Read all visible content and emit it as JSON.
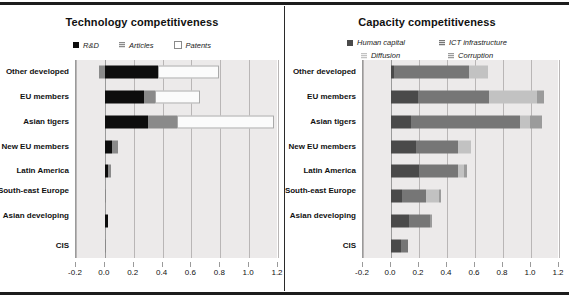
{
  "figure": {
    "background": "#ffffff",
    "plot_background": "#eceaea",
    "rule_color": "#1d1d1d"
  },
  "charts": [
    {
      "id": "technology",
      "title": "Technology competitiveness",
      "legend": [
        {
          "label": "R&D",
          "color": "#0d0d0d",
          "style": "solid"
        },
        {
          "label": "Articles",
          "color": "#8a8a8a",
          "style": "hatch"
        },
        {
          "label": "Patents",
          "color": "#ffffff",
          "style": "outline"
        }
      ],
      "xticks": [
        "-0.2",
        "0.0",
        "0.2",
        "0.4",
        "0.6",
        "0.8",
        "1.0",
        "1.2"
      ],
      "categories": [
        "Other developed",
        "EU members",
        "Asian tigers",
        "New EU members",
        "Latin America",
        "South-east Europe",
        "Asian developing",
        "CIS"
      ]
    },
    {
      "id": "capacity",
      "title": "Capacity competitiveness",
      "legend": [
        {
          "label": "Human capital",
          "color": "#4a4a4a",
          "style": "solid"
        },
        {
          "label": "ICT infrastructure",
          "color": "#767676",
          "style": "hatch"
        },
        {
          "label": "Diffusion",
          "color": "#c2c2c2",
          "style": "hatch"
        },
        {
          "label": "Corruption",
          "color": "#9b9b9b",
          "style": "hatch"
        }
      ],
      "xticks": [
        "-0.2",
        "0.0",
        "0.2",
        "0.4",
        "0.6",
        "0.8",
        "1.0",
        "1.2"
      ],
      "categories": [
        "Other developed",
        "EU members",
        "Asian tigers",
        "New EU members",
        "Latin America",
        "South-east Europe",
        "Asian developing",
        "CIS"
      ]
    }
  ],
  "chart_data": [
    {
      "type": "bar",
      "orientation": "horizontal",
      "stacked": true,
      "title": "Technology competitiveness",
      "xlabel": "",
      "ylabel": "",
      "xlim": [
        -0.2,
        1.2
      ],
      "xticks": [
        -0.2,
        0.0,
        0.2,
        0.4,
        0.6,
        0.8,
        1.0,
        1.2
      ],
      "grid": true,
      "legend_position": "top-center",
      "categories": [
        "Other developed",
        "EU members",
        "Asian tigers",
        "New EU members",
        "Latin America",
        "South-east Europe",
        "Asian developing",
        "CIS"
      ],
      "series": [
        {
          "name": "R&D",
          "color": "#0d0d0d",
          "values": [
            0.37,
            0.27,
            0.3,
            0.05,
            0.02,
            0.0,
            0.02,
            0.0
          ]
        },
        {
          "name": "Articles",
          "color": "#8a8a8a",
          "values": [
            0.0,
            0.08,
            0.2,
            0.04,
            0.02,
            0.01,
            0.0,
            0.01
          ]
        },
        {
          "name": "Patents",
          "color": "#ffffff",
          "values": [
            0.42,
            0.31,
            0.67,
            0.0,
            0.0,
            0.0,
            0.0,
            0.0
          ]
        }
      ],
      "negative_segments": [
        {
          "category": "Other developed",
          "series": "Articles",
          "value": -0.04
        }
      ],
      "totals": [
        0.79,
        0.66,
        1.17,
        0.09,
        0.04,
        0.01,
        0.02,
        0.01
      ]
    },
    {
      "type": "bar",
      "orientation": "horizontal",
      "stacked": true,
      "title": "Capacity competitiveness",
      "xlabel": "",
      "ylabel": "",
      "xlim": [
        -0.2,
        1.2
      ],
      "xticks": [
        -0.2,
        0.0,
        0.2,
        0.4,
        0.6,
        0.8,
        1.0,
        1.2
      ],
      "grid": true,
      "legend_position": "top-center",
      "categories": [
        "Other developed",
        "EU members",
        "Asian tigers",
        "New EU members",
        "Latin America",
        "South-east Europe",
        "Asian developing",
        "CIS"
      ],
      "series": [
        {
          "name": "Human capital",
          "color": "#4a4a4a",
          "values": [
            0.02,
            0.19,
            0.14,
            0.18,
            0.2,
            0.08,
            0.13,
            0.07
          ]
        },
        {
          "name": "ICT infrastructure",
          "color": "#767676",
          "values": [
            0.54,
            0.51,
            0.78,
            0.3,
            0.28,
            0.17,
            0.15,
            0.05
          ]
        },
        {
          "name": "Diffusion",
          "color": "#c2c2c2",
          "values": [
            0.13,
            0.34,
            0.07,
            0.09,
            0.04,
            0.09,
            0.0,
            0.0
          ]
        },
        {
          "name": "Corruption",
          "color": "#9b9b9b",
          "values": [
            0.0,
            0.05,
            0.09,
            0.0,
            0.02,
            0.02,
            0.01,
            0.0
          ]
        }
      ],
      "totals": [
        0.69,
        1.09,
        1.08,
        0.57,
        0.54,
        0.36,
        0.29,
        0.12
      ]
    }
  ]
}
